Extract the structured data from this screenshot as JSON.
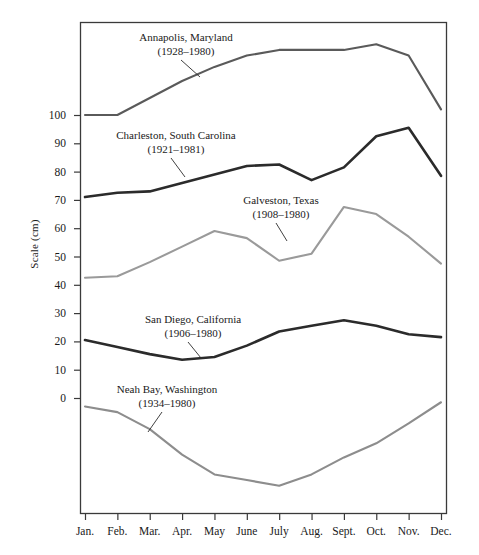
{
  "chart_data": {
    "type": "line",
    "title": "",
    "xlabel": "",
    "ylabel": "Scale (cm)",
    "categories": [
      "Jan.",
      "Feb.",
      "Mar.",
      "Apr.",
      "May",
      "June",
      "July",
      "Aug.",
      "Sept.",
      "Oct.",
      "Nov.",
      "Dec."
    ],
    "ytick_labels": [
      "100",
      "90",
      "80",
      "70",
      "60",
      "50",
      "40",
      "30",
      "20",
      "10",
      "0"
    ],
    "ytick_values": [
      100,
      90,
      80,
      70,
      60,
      50,
      40,
      30,
      20,
      10,
      0
    ],
    "ylim": [
      -96,
      131
    ],
    "grid": false,
    "legend_position": "inline-annotations",
    "series": [
      {
        "name": "Annapolis, Maryland",
        "years": "(1928–1980)",
        "color": "#5a5a5a",
        "width": 2.1,
        "values": [
          100,
          100,
          106,
          112,
          117,
          121,
          123,
          123,
          123,
          125,
          121,
          102
        ]
      },
      {
        "name": "Charleston, South Carolina",
        "years": "(1921–1981)",
        "color": "#2b2b2b",
        "width": 2.6,
        "values": [
          71,
          72.5,
          73,
          76,
          79,
          82,
          82.5,
          77,
          81.5,
          92.5,
          95.5,
          78.5
        ]
      },
      {
        "name": "Galveston, Texas",
        "years": "(1908–1980)",
        "color": "#9a9a9a",
        "width": 2.1,
        "values": [
          42.5,
          43,
          48,
          53.5,
          59,
          56.5,
          48.5,
          51,
          67.5,
          65,
          57,
          47.5
        ]
      },
      {
        "name": "San Diego, California",
        "years": "(1906–1980)",
        "color": "#2b2b2b",
        "width": 2.6,
        "values": [
          20.5,
          18,
          15.5,
          13.5,
          14.5,
          18.5,
          23.5,
          25.5,
          27.5,
          25.5,
          22.5,
          21.5
        ]
      },
      {
        "name": "Neah Bay, Washington",
        "years": "(1934–1980)",
        "color": "#8d8d8d",
        "width": 2.1,
        "values": [
          -3,
          -5,
          -11,
          -20,
          -27,
          -29,
          -31,
          -27,
          -21,
          -16,
          -9,
          -1.5
        ]
      }
    ],
    "annotations": [
      {
        "label_index": 0,
        "text_x": 186,
        "text_y": 31,
        "leader_from": [
          181,
          60
        ],
        "leader_to": [
          200,
          77
        ]
      },
      {
        "label_index": 1,
        "text_x": 176,
        "text_y": 129,
        "leader_from": [
          171,
          158
        ],
        "leader_to": [
          185,
          177
        ]
      },
      {
        "label_index": 2,
        "text_x": 281,
        "text_y": 194,
        "leader_from": [
          276,
          223
        ],
        "leader_to": [
          287,
          241
        ]
      },
      {
        "label_index": 3,
        "text_x": 193,
        "text_y": 313,
        "leader_from": [
          188,
          342
        ],
        "leader_to": [
          201,
          358
        ]
      },
      {
        "label_index": 4,
        "text_x": 167,
        "text_y": 383,
        "leader_from": [
          162,
          412
        ],
        "leader_to": [
          148,
          432
        ]
      }
    ]
  },
  "plot": {
    "frame": {
      "left": 80,
      "top": 22,
      "right": 446,
      "bottom": 513
    },
    "x_first": 85,
    "x_last": 441,
    "y_zero": 398,
    "px_per_unit": 2.83
  }
}
